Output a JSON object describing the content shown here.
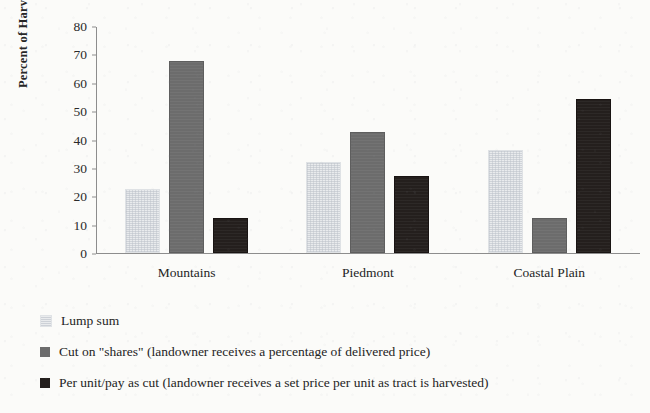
{
  "chart_data": {
    "type": "bar",
    "title": "",
    "subtitle": "",
    "xlabel": "",
    "ylabel": "Percent of Harvests",
    "categories": [
      "Mountains",
      "Piedmont",
      "Coastal Plain"
    ],
    "series": [
      {
        "name": "Lump sum",
        "color": "#e9ebed",
        "values": [
          22,
          31.5,
          35.5
        ]
      },
      {
        "name": "Cut on \"shares\" (landowner receives a percentage of delivered price)",
        "color": "#6c6c6c",
        "values": [
          67,
          42,
          11.5
        ]
      },
      {
        "name": "Per unit/pay as cut (landowner receives a set price per unit as tract is harvested)",
        "color": "#241f1d",
        "values": [
          11.5,
          26.5,
          53.5
        ]
      }
    ],
    "ylim": [
      0,
      80
    ],
    "yticks": [
      0,
      10,
      20,
      30,
      40,
      50,
      60,
      70,
      80
    ],
    "ytick_labels": [
      "0",
      "10",
      "20",
      "30",
      "40",
      "50",
      "60",
      "70",
      "80"
    ],
    "grid": false,
    "legend_position": "bottom-left",
    "background_color": "#fbfbf9",
    "axis_color": "#8d8d8d"
  }
}
